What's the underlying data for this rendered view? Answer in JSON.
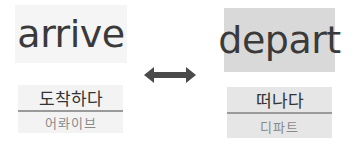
{
  "left": {
    "word": "arrive",
    "meaning": "도착하다",
    "pronunciation": "어롸이브"
  },
  "right": {
    "word": "depart",
    "meaning": "떠나다",
    "pronunciation": "디파트"
  },
  "connector": {
    "icon": "double-arrow-icon",
    "relation": "antonym"
  },
  "colors": {
    "text": "#3a3a3a",
    "arrow": "#4a4a4a",
    "depart_bg": "#d9d9d9",
    "arrive_bg": "#f5f5f5",
    "divider": "#9a9a9a"
  }
}
